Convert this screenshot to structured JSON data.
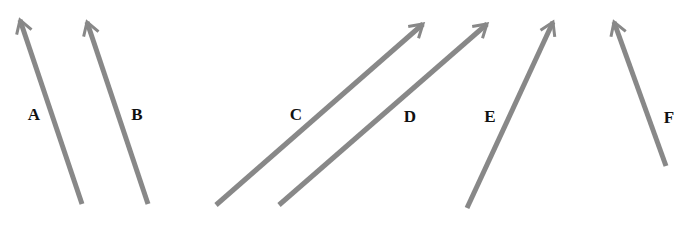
{
  "diagram": {
    "arrow_color": "#888888",
    "label_color": "#111111",
    "arrows": [
      {
        "id": "A",
        "label": "A",
        "tail": [
          82,
          204
        ],
        "head": [
          20,
          20
        ],
        "label_pos": [
          34,
          120
        ]
      },
      {
        "id": "B",
        "label": "B",
        "tail": [
          148,
          204
        ],
        "head": [
          87,
          22
        ],
        "label_pos": [
          137,
          120
        ]
      },
      {
        "id": "C",
        "label": "C",
        "tail": [
          216,
          205
        ],
        "head": [
          423,
          24
        ],
        "label_pos": [
          296,
          120
        ]
      },
      {
        "id": "D",
        "label": "D",
        "tail": [
          279,
          205
        ],
        "head": [
          487,
          24
        ],
        "label_pos": [
          410,
          122
        ]
      },
      {
        "id": "E",
        "label": "E",
        "tail": [
          467,
          208
        ],
        "head": [
          553,
          22
        ],
        "label_pos": [
          490,
          122
        ]
      },
      {
        "id": "F",
        "label": "F",
        "tail": [
          666,
          166
        ],
        "head": [
          614,
          22
        ],
        "label_pos": [
          669,
          123
        ]
      }
    ]
  }
}
